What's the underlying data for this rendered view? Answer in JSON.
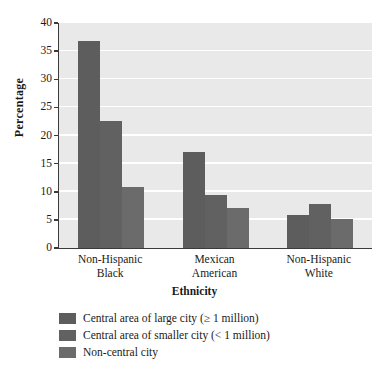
{
  "chart_data": {
    "type": "bar",
    "title": "",
    "xlabel": "Ethnicity",
    "ylabel": "Percentage",
    "categories": [
      "Non-Hispanic Black",
      "Mexican American",
      "Non-Hispanic White"
    ],
    "category_lines": [
      [
        "Non-Hispanic",
        "Black"
      ],
      [
        "Mexican",
        "American"
      ],
      [
        "Non-Hispanic",
        "White"
      ]
    ],
    "series": [
      {
        "name": "Central area of large city (≥ 1 million)",
        "color": "#5d5d5d",
        "values": [
          36.8,
          17.1,
          5.9
        ]
      },
      {
        "name": "Central area of smaller city (< 1 million)",
        "color": "#616161",
        "values": [
          22.6,
          9.5,
          7.9
        ]
      },
      {
        "name": "Non-central city",
        "color": "#6b6b6b",
        "values": [
          10.9,
          7.1,
          5.2
        ]
      }
    ],
    "ylim": [
      0,
      40
    ],
    "yticks": [
      0,
      5,
      10,
      15,
      20,
      25,
      30,
      35,
      40
    ],
    "ytick_labels": [
      "0",
      "5",
      "10",
      "15",
      "20",
      "25",
      "30",
      "35",
      "40"
    ],
    "grid": true,
    "grid_color": "#ffffff",
    "plot_background": "#e9e9e9",
    "legend_position": "below"
  },
  "legend": {
    "entries": [
      "Central area of large city (≥ 1 million)",
      "Central area of smaller city (< 1 million)",
      "Non-central city"
    ]
  },
  "axes": {
    "y_title": "Percentage",
    "x_title": "Ethnicity"
  }
}
